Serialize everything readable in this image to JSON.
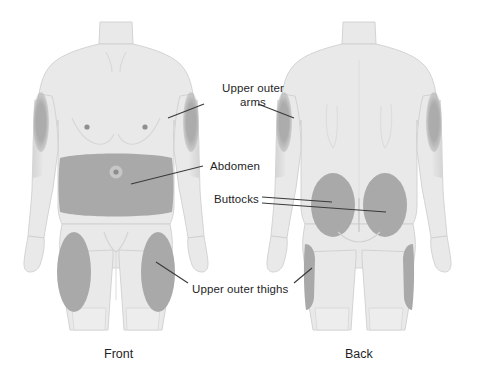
{
  "illustration": {
    "title": "Injection site body map",
    "colors": {
      "background": "#ffffff",
      "body_fill": "#e9e9e9",
      "body_outline": "#c9c9c9",
      "site_highlight": "#a9a9a9",
      "shading": "#d2d2d2",
      "leader_line": "#3a3a3a",
      "text": "#1f1f1f"
    },
    "callouts": [
      {
        "id": "upper-outer-arms",
        "line1": "Upper outer",
        "line2": "arms",
        "full": "Upper outer arms"
      },
      {
        "id": "abdomen",
        "full": "Abdomen"
      },
      {
        "id": "buttocks",
        "full": "Buttocks"
      },
      {
        "id": "upper-outer-thighs",
        "full": "Upper outer thighs"
      }
    ],
    "views": [
      {
        "id": "front",
        "caption": "Front"
      },
      {
        "id": "back",
        "caption": "Back"
      }
    ]
  }
}
